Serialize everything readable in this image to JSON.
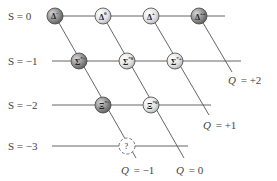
{
  "diagram": {
    "colors": {
      "line": "#555555",
      "dark_particle": "#8a8a8a",
      "light_particle": "#d9d9d9",
      "particle_stroke": "#444444",
      "text": "#444444"
    },
    "strangeness_rows": [
      {
        "label": "S = 0",
        "y": 16,
        "line_x1": 60,
        "line_x2": 225
      },
      {
        "label": "S = −1",
        "y": 61,
        "line_x1": 52,
        "line_x2": 241
      },
      {
        "label": "S = −2",
        "y": 105,
        "line_x1": 52,
        "line_x2": 211
      },
      {
        "label": "S = −3",
        "y": 146,
        "line_x1": 52,
        "line_x2": 188
      }
    ],
    "charge_lines": [
      {
        "label_var": "Q",
        "label_val": "= +2",
        "x1": 199,
        "y1": 16,
        "x2": 232,
        "y2": 70,
        "lx": 230,
        "ly": 82
      },
      {
        "label_var": "Q",
        "label_val": "= +1",
        "x1": 151,
        "y1": 16,
        "x2": 208,
        "y2": 113,
        "lx": 205,
        "ly": 127
      },
      {
        "label_var": "Q",
        "label_val": "= 0",
        "x1": 103,
        "y1": 16,
        "x2": 184,
        "y2": 158,
        "lx": 177,
        "ly": 173
      },
      {
        "label_var": "Q",
        "label_val": "= −1",
        "x1": 55,
        "y1": 16,
        "x2": 135,
        "y2": 158,
        "lx": 122,
        "ly": 173
      }
    ],
    "particles": [
      {
        "name": "delta-minus",
        "symbol": "Δ",
        "sup": "−",
        "cx": 55,
        "cy": 16,
        "shade": "dark"
      },
      {
        "name": "delta-zero",
        "symbol": "Δ",
        "sup": "0",
        "cx": 103,
        "cy": 16,
        "shade": "light"
      },
      {
        "name": "delta-plus",
        "symbol": "Δ",
        "sup": "+",
        "cx": 151,
        "cy": 16,
        "shade": "light"
      },
      {
        "name": "delta-plus-plus",
        "symbol": "Δ",
        "sup": "++",
        "cx": 199,
        "cy": 16,
        "shade": "dark"
      },
      {
        "name": "sigma-star-minus",
        "symbol": "Σ",
        "sup": "*−",
        "cx": 79,
        "cy": 61,
        "shade": "dark"
      },
      {
        "name": "sigma-star-zero",
        "symbol": "Σ",
        "sup": "*0",
        "cx": 127,
        "cy": 61,
        "shade": "light"
      },
      {
        "name": "sigma-star-plus",
        "symbol": "Σ",
        "sup": "*+",
        "cx": 175,
        "cy": 61,
        "shade": "light"
      },
      {
        "name": "xi-star-minus",
        "symbol": "Ξ",
        "sup": "*−",
        "cx": 103,
        "cy": 105,
        "shade": "dark"
      },
      {
        "name": "xi-star-zero",
        "symbol": "Ξ",
        "sup": "*0",
        "cx": 151,
        "cy": 105,
        "shade": "light"
      },
      {
        "name": "unknown-particle",
        "symbol": "?",
        "sup": "",
        "cx": 127,
        "cy": 146,
        "shade": "unknown"
      }
    ]
  }
}
